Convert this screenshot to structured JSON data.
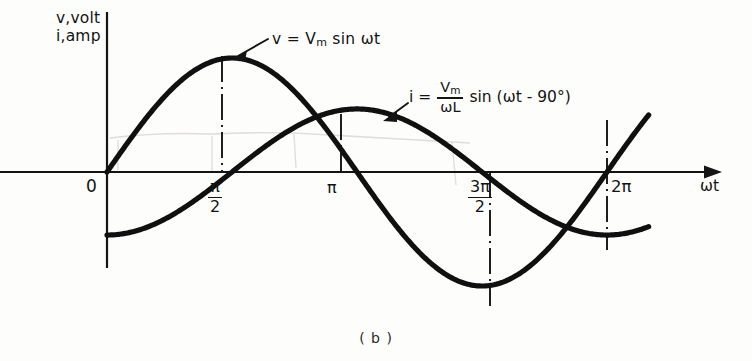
{
  "figure": {
    "caption": "( b )",
    "axis_y_label_line1": "v,volt",
    "axis_y_label_line2": "i,amp",
    "axis_x_label": "ωt",
    "stroke_color": "#101010",
    "background_color": "#fdfdfc"
  },
  "annotations": {
    "voltage_equation": "v = Vₘ sin ωt",
    "voltage_eq_lhs": "v = V",
    "voltage_eq_sub": "m",
    "voltage_eq_rhs": " sin ωt",
    "current_eq_lhs": "i =",
    "current_eq_num": "V",
    "current_eq_num_sub": "m",
    "current_eq_den": "ωL",
    "current_eq_rhs": "sin (ωt - 90°)",
    "current_equation": "i = (Vₘ/ωL) sin (ωt - 90°)"
  },
  "ticks": {
    "zero": "0",
    "pi_over_2_num": "π",
    "pi_over_2_den": "2",
    "pi": "π",
    "three_pi_over_2_num": "3π",
    "three_pi_over_2_den": "2",
    "two_pi": "2π"
  },
  "chart_data": {
    "type": "line",
    "title": "",
    "subtitle": "( b )",
    "xlabel": "ωt",
    "ylabel": "v,volt / i,amp",
    "xlim": [
      0,
      6.8068
    ],
    "ylim": [
      -1.25,
      1.25
    ],
    "grid": false,
    "legend": "inline-annotations",
    "x_tick_values": [
      0,
      1.5708,
      3.1416,
      4.7124,
      6.2832
    ],
    "x_tick_labels": [
      "0",
      "π/2",
      "π",
      "3π/2",
      "2π"
    ],
    "y_tick_values": [],
    "y_tick_labels": [],
    "series": [
      {
        "name": "v = Vₘ sin ωt",
        "equation": "v = Vm * sin(wt)",
        "amplitude": 1.0,
        "phase_deg": 0,
        "x": [
          0,
          0.3927,
          0.7854,
          1.1781,
          1.5708,
          1.9635,
          2.3562,
          2.7489,
          3.1416,
          3.5343,
          3.927,
          4.3197,
          4.7124,
          5.1051,
          5.4978,
          5.8905,
          6.2832,
          6.6759
        ],
        "y": [
          0.0,
          0.383,
          0.707,
          0.924,
          1.0,
          0.924,
          0.707,
          0.383,
          0.0,
          -0.383,
          -0.707,
          -0.924,
          -1.0,
          -0.924,
          -0.707,
          -0.383,
          0.0,
          0.383
        ]
      },
      {
        "name": "i = (Vₘ/ωL) sin (ωt - 90°)",
        "equation": "i = (Vm/wL) * sin(wt - 90deg)",
        "amplitude": 0.553,
        "phase_deg": -90,
        "x": [
          0,
          0.3927,
          0.7854,
          1.1781,
          1.5708,
          1.9635,
          2.3562,
          2.7489,
          3.1416,
          3.5343,
          3.927,
          4.3197,
          4.7124,
          5.1051,
          5.4978,
          5.8905,
          6.2832,
          6.6759
        ],
        "y": [
          -0.553,
          -0.511,
          -0.391,
          -0.212,
          0.0,
          0.212,
          0.391,
          0.511,
          0.553,
          0.511,
          0.391,
          0.212,
          0.0,
          -0.212,
          -0.391,
          -0.511,
          -0.553,
          -0.511
        ]
      }
    ],
    "reference_lines": [
      {
        "at": 1.5708,
        "style": "dash-dot",
        "orientation": "vertical",
        "note": "voltage peak at pi/2"
      },
      {
        "at": 3.1416,
        "style": "dash-dot",
        "orientation": "vertical",
        "note": "current peak at pi"
      },
      {
        "at": 4.7124,
        "style": "dash-dot",
        "orientation": "vertical",
        "note": "voltage trough at 3pi/2"
      },
      {
        "at": 6.2832,
        "style": "dash-dot",
        "orientation": "vertical",
        "note": "current trough at 2pi"
      }
    ]
  }
}
